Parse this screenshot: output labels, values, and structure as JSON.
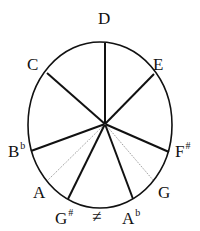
{
  "diagram": {
    "type": "tone-circle",
    "center": {
      "x": 105,
      "y": 124
    },
    "ellipse": {
      "cx": 100,
      "cy": 125,
      "rx": 72,
      "ry": 83
    },
    "labels": [
      {
        "id": "D",
        "base": "D",
        "sup": "",
        "x": 98,
        "y": 24
      },
      {
        "id": "C",
        "base": "C",
        "sup": "",
        "x": 27,
        "y": 70
      },
      {
        "id": "E",
        "base": "E",
        "sup": "",
        "x": 153,
        "y": 70
      },
      {
        "id": "Bb",
        "base": "B",
        "sup": "b",
        "x": 8,
        "y": 157
      },
      {
        "id": "Fs",
        "base": "F",
        "sup": "#",
        "x": 175,
        "y": 157
      },
      {
        "id": "A",
        "base": "A",
        "sup": "",
        "x": 33,
        "y": 198
      },
      {
        "id": "G",
        "base": "G",
        "sup": "",
        "x": 158,
        "y": 198
      },
      {
        "id": "Gs",
        "base": "G",
        "sup": "#",
        "x": 55,
        "y": 224
      },
      {
        "id": "Ab",
        "base": "A",
        "sup": "b",
        "x": 122,
        "y": 224
      }
    ],
    "symbol": {
      "text": "≠",
      "x": 92,
      "y": 222
    },
    "spokes": [
      {
        "to": "D",
        "x": 105,
        "y": 43,
        "style": "solid"
      },
      {
        "to": "C",
        "x": 47,
        "y": 73,
        "style": "solid"
      },
      {
        "to": "E",
        "x": 154,
        "y": 74,
        "style": "solid"
      },
      {
        "to": "Bb",
        "x": 31,
        "y": 151,
        "style": "solid"
      },
      {
        "to": "Fs",
        "x": 169,
        "y": 152,
        "style": "solid"
      },
      {
        "to": "Gs",
        "x": 68,
        "y": 199,
        "style": "solid"
      },
      {
        "to": "Ab",
        "x": 133,
        "y": 199,
        "style": "solid"
      },
      {
        "to": "A",
        "x": 48,
        "y": 180,
        "style": "dotted"
      },
      {
        "to": "G",
        "x": 153,
        "y": 180,
        "style": "dotted"
      }
    ]
  }
}
